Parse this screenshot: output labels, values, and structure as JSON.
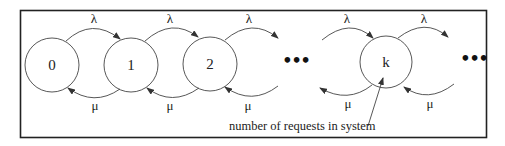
{
  "diagram": {
    "type": "birth-death Markov chain",
    "states": [
      {
        "id": "s0",
        "label": "0"
      },
      {
        "id": "s1",
        "label": "1"
      },
      {
        "id": "s2",
        "label": "2"
      },
      {
        "id": "sk",
        "label": "k"
      }
    ],
    "ellipses": [
      "•••",
      "•••"
    ],
    "arrival_rate_label": "λ",
    "service_rate_label": "μ",
    "annotation": "number of requests in system",
    "transitions": [
      {
        "from": "0",
        "to": "1",
        "label": "λ"
      },
      {
        "from": "1",
        "to": "0",
        "label": "μ"
      },
      {
        "from": "1",
        "to": "2",
        "label": "λ"
      },
      {
        "from": "2",
        "to": "1",
        "label": "μ"
      },
      {
        "from": "2",
        "to": "…",
        "label": "λ"
      },
      {
        "from": "…",
        "to": "2",
        "label": "μ"
      },
      {
        "from": "…",
        "to": "k",
        "label": "λ"
      },
      {
        "from": "k",
        "to": "…",
        "label": "μ"
      },
      {
        "from": "k",
        "to": "…",
        "label": "λ"
      },
      {
        "from": "…",
        "to": "k",
        "label": "μ"
      }
    ]
  }
}
